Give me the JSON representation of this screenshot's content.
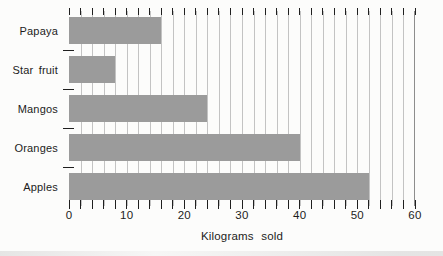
{
  "figure": {
    "background_color": "#fcfcfb"
  },
  "chart_data": {
    "type": "bar",
    "orientation": "horizontal",
    "title": "",
    "xlabel": "Kilograms sold",
    "ylabel": "",
    "categories": [
      "Papaya",
      "Star fruit",
      "Mangos",
      "Oranges",
      "Apples"
    ],
    "values": [
      16,
      8,
      24,
      40,
      52
    ],
    "xlim": [
      0,
      60
    ],
    "x_major_ticks": [
      0,
      10,
      20,
      30,
      40,
      50,
      60
    ],
    "x_minor_tick_step": 2,
    "grid": "vertical-minor-gridlines",
    "legend": "none",
    "bar_color": "#9b9b9b",
    "gridline_color": "#c3c3c3",
    "axis_color": "#1f1f1f",
    "text_color": "#1c1c1c"
  }
}
